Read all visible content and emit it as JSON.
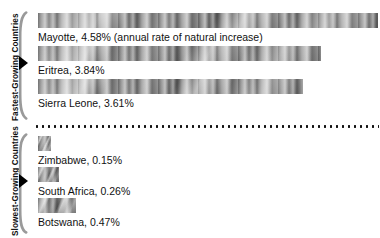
{
  "chart_data": {
    "type": "bar",
    "title": "",
    "xlabel": "",
    "ylabel": "",
    "orientation": "horizontal",
    "value_unit": "percent",
    "value_note": "annual rate of natural increase",
    "groups": [
      {
        "name": "Fastest-Growing Countries",
        "categories": [
          "Mayotte",
          "Eritrea",
          "Sierra Leone"
        ],
        "values": [
          4.58,
          3.84,
          3.61
        ]
      },
      {
        "name": "Slowest-Growing Countries",
        "categories": [
          "Zimbabwe",
          "South Africa",
          "Botswana"
        ],
        "values": [
          0.15,
          0.26,
          0.47
        ]
      }
    ]
  },
  "groups": {
    "fastest": {
      "label": "Fastest-Growing Countries"
    },
    "slowest": {
      "label": "Slowest-Growing Countries"
    }
  },
  "bars": [
    {
      "key": "mayotte",
      "label": "Mayotte, 4.58% (annual rate of natural increase)",
      "value": 4.58,
      "width_px": 340
    },
    {
      "key": "eritrea",
      "label": "Eritrea, 3.84%",
      "value": 3.84,
      "width_px": 283
    },
    {
      "key": "sierraleone",
      "label": "Sierra Leone, 3.61%",
      "value": 3.61,
      "width_px": 265
    },
    {
      "key": "zimbabwe",
      "label": "Zimbabwe, 0.15%",
      "value": 0.15,
      "width_px": 13
    },
    {
      "key": "southafrica",
      "label": "South Africa, 0.26%",
      "value": 0.26,
      "width_px": 21
    },
    {
      "key": "botswana",
      "label": "Botswana, 0.47%",
      "value": 0.47,
      "width_px": 38
    }
  ],
  "colors": {
    "bar_fill": "#8e8e8e",
    "bracket": "#9a9a9a",
    "arrow": "#000000",
    "text": "#111111",
    "divider": "#111111",
    "background": "#ffffff"
  }
}
